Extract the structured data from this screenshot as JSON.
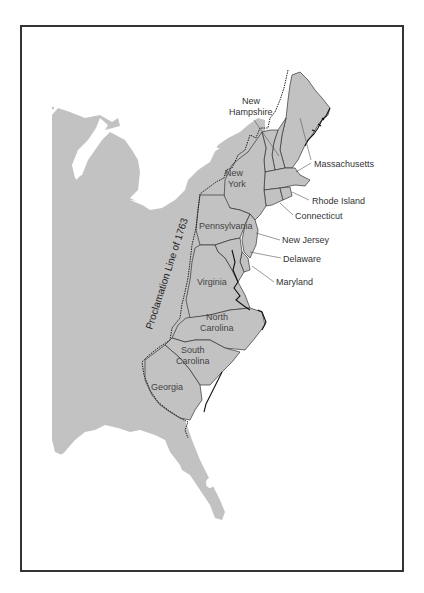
{
  "map": {
    "title": "Thirteen Colonies and the Proclamation Line of 1763",
    "proclamation_line_label": "Proclamation Line of 1763",
    "colonies": {
      "new_hampshire": [
        "New",
        "Hampshire"
      ],
      "massachusetts": "Massachusetts",
      "new_york": [
        "New",
        "York"
      ],
      "rhode_island": "Rhode Island",
      "connecticut": "Connecticut",
      "pennsylvania": "Pennsylvania",
      "new_jersey": "New Jersey",
      "delaware": "Delaware",
      "maryland": "Maryland",
      "virginia": "Virginia",
      "north_carolina": [
        "North",
        "Carolina"
      ],
      "south_carolina": [
        "South",
        "Carolina"
      ],
      "georgia": "Georgia"
    },
    "colors": {
      "land": "#c2c2c2",
      "water": "#ffffff",
      "frame": "#333333",
      "label": "#444444"
    }
  }
}
